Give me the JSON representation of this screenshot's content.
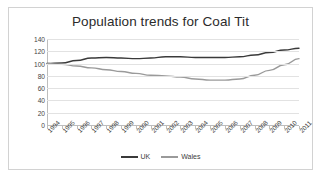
{
  "chart_data": {
    "type": "line",
    "title": "Population trends for Coal Tit",
    "xlabel": "",
    "ylabel": "",
    "grid": true,
    "legend_position": "bottom",
    "ylim": [
      0,
      140
    ],
    "yticks": [
      0,
      20,
      40,
      60,
      80,
      100,
      120,
      140
    ],
    "categories": [
      "1994",
      "1995",
      "1996",
      "1997",
      "1998",
      "1999",
      "2000",
      "2001",
      "2002",
      "2003",
      "2004",
      "2005",
      "2006",
      "2007",
      "2008",
      "2009",
      "2010",
      "2011"
    ],
    "series": [
      {
        "name": "UK",
        "color": "#3a3a3a",
        "values": [
          100,
          101,
          105,
          109,
          110,
          109,
          108,
          109,
          111,
          111,
          110,
          110,
          110,
          111,
          114,
          118,
          122,
          125
        ]
      },
      {
        "name": "Wales",
        "color": "#9a9a9a",
        "values": [
          100,
          99,
          96,
          93,
          90,
          87,
          84,
          81,
          80,
          78,
          75,
          73,
          73,
          75,
          81,
          89,
          98,
          108
        ]
      }
    ]
  },
  "legend": {
    "items": [
      {
        "label": "UK"
      },
      {
        "label": "Wales"
      }
    ]
  }
}
